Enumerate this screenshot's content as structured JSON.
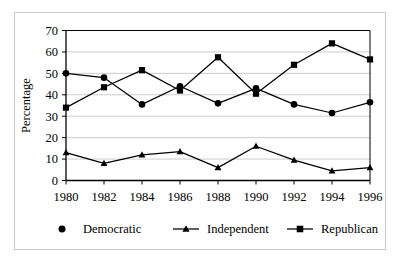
{
  "chart_data": {
    "type": "line",
    "title": "",
    "xlabel": "",
    "ylabel": "Percentage",
    "categories": [
      "1980",
      "1982",
      "1984",
      "1986",
      "1988",
      "1990",
      "1992",
      "1994",
      "1996"
    ],
    "ylim": [
      0,
      70
    ],
    "yticks": [
      0,
      10,
      20,
      30,
      40,
      50,
      60,
      70
    ],
    "ytick_labels": [
      "0",
      "10",
      "20",
      "30",
      "40",
      "50",
      "60",
      "70"
    ],
    "grid": "horizontal",
    "legend_position": "bottom",
    "series": [
      {
        "name": "Democratic",
        "marker": "circle",
        "color": "#000000",
        "values": [
          50,
          48,
          35.5,
          44,
          36,
          43,
          35.5,
          31.5,
          36.5
        ]
      },
      {
        "name": "Independent",
        "marker": "triangle",
        "color": "#000000",
        "values": [
          13,
          8,
          12,
          13.5,
          6,
          16,
          9.5,
          4.5,
          6
        ]
      },
      {
        "name": "Republican",
        "marker": "square",
        "color": "#000000",
        "values": [
          34,
          43.5,
          51.5,
          42,
          57.5,
          40.5,
          54,
          64,
          56.5
        ]
      }
    ]
  },
  "axes": {
    "y_title": "Percentage"
  },
  "legend": {
    "items": [
      {
        "label": "Democratic",
        "marker": "circle"
      },
      {
        "label": "Independent",
        "marker": "triangle"
      },
      {
        "label": "Republican",
        "marker": "square"
      }
    ]
  },
  "colors": {
    "ink": "#000000",
    "grid": "#bfbfbf",
    "frame": "#c9c9c9",
    "background": "#ffffff"
  }
}
